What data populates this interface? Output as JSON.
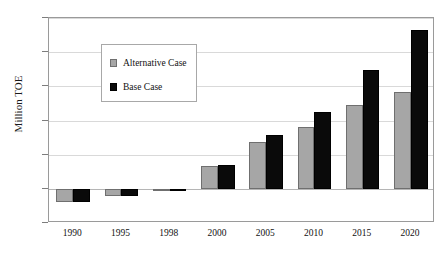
{
  "chart_data": {
    "type": "bar",
    "title": "",
    "xlabel": "",
    "ylabel": "Million TOE",
    "ylim": [
      -50,
      250
    ],
    "ytick_values": [
      250,
      200,
      150,
      100,
      50,
      0,
      -50
    ],
    "ytick_labels": [
      "250",
      "200",
      "150",
      "100",
      "50",
      "0",
      "-50"
    ],
    "grid": true,
    "legend_position": "upper-left-inside",
    "categories": [
      "1990",
      "1995",
      "1998",
      "2000",
      "2005",
      "2010",
      "2015",
      "2020"
    ],
    "series": [
      {
        "name": "Alternative Case",
        "color": "#A6A6A6",
        "values": [
          -20,
          -11,
          -3,
          34,
          68,
          90,
          122,
          141
        ]
      },
      {
        "name": "Base Case",
        "color": "#0A0A0A",
        "values": [
          -20,
          -11,
          -3,
          35,
          79,
          112,
          174,
          232
        ]
      }
    ]
  },
  "legend": {
    "items": [
      {
        "label": "Alternative Case",
        "swatch": "alt"
      },
      {
        "label": "Base Case",
        "swatch": "base"
      }
    ]
  },
  "axis": {
    "y_title": "Million TOE"
  }
}
